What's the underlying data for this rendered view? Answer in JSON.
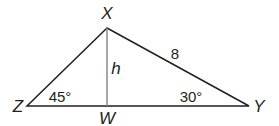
{
  "diagram": {
    "type": "triangle-with-altitude",
    "vertices": {
      "X": {
        "label": "X",
        "x": 107,
        "y": 28
      },
      "Z": {
        "label": "Z",
        "x": 27,
        "y": 106
      },
      "W": {
        "label": "W",
        "x": 107,
        "y": 106
      },
      "Y": {
        "label": "Y",
        "x": 249,
        "y": 106
      }
    },
    "altitude_label": "h",
    "side_XY_label": "8",
    "angle_Z_label": "45°",
    "angle_Y_label": "30°",
    "colors": {
      "stroke": "#231f20",
      "altitude": "#8a8a8a",
      "background": "#ffffff"
    }
  }
}
